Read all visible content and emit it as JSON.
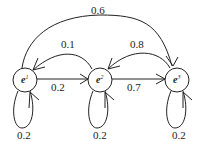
{
  "nodes": [
    {
      "id": "e1",
      "base": "e",
      "sup": "1"
    },
    {
      "id": "e2",
      "base": "e",
      "sup": "2"
    },
    {
      "id": "e3",
      "base": "e",
      "sup": "3"
    }
  ],
  "edges": {
    "e1_e3": "0.6",
    "e2_e1": "0.1",
    "e3_e2": "0.8",
    "e1_e2": "0.2",
    "e2_e3": "0.7",
    "e1_self": "0.2",
    "e2_self": "0.2",
    "e3_self": "0.2"
  },
  "colors": {
    "stroke": "#222222",
    "background": "#ffffff"
  }
}
